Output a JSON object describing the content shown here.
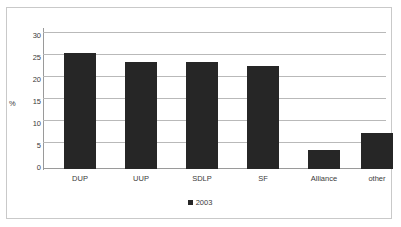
{
  "chart_data": {
    "type": "bar",
    "title": "",
    "subtitle": "",
    "xlabel": "",
    "ylabel": "%",
    "categories": [
      "DUP",
      "UUP",
      "SDLP",
      "SF",
      "Alliance",
      "other"
    ],
    "series": [
      {
        "name": "2003",
        "color": "#262626",
        "values": [
          25.7,
          23.6,
          23.6,
          22.8,
          4.3,
          7.9
        ]
      }
    ],
    "ylim": [
      0,
      30
    ],
    "ytick_labels": [
      "30",
      "25",
      "20",
      "15",
      "10",
      "5",
      "0"
    ],
    "ytick_values": [
      30,
      25,
      20,
      15,
      10,
      5,
      0
    ],
    "grid": true,
    "legend": {
      "position": "bottom-center",
      "entries": [
        {
          "label": "2003",
          "color": "#262626",
          "marker": "square"
        }
      ]
    },
    "frame": {
      "border_color": "#c9c9c9",
      "background": "#ffffff",
      "gridline_color": "#b9b9b9",
      "axis_color": "#9a9a9a",
      "text_color": "#3a3a3a"
    }
  }
}
